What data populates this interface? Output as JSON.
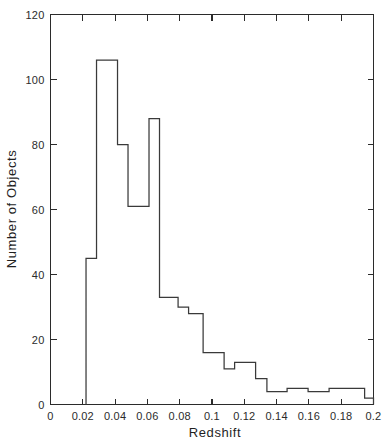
{
  "chart_data": {
    "type": "bar",
    "title": "",
    "xlabel": "Redshift",
    "ylabel": "Number of Objects",
    "xlim": [
      0,
      0.2
    ],
    "ylim": [
      0,
      120
    ],
    "grid": false,
    "legend": null,
    "xticks": [
      "0",
      "0.02",
      "0.04",
      "0.06",
      "0.08",
      "0.1",
      "0.12",
      "0.14",
      "0.16",
      "0.18",
      "0.2"
    ],
    "xtick_values": [
      0,
      0.02,
      0.04,
      0.06,
      0.08,
      0.1,
      0.12,
      0.14,
      0.16,
      0.18,
      0.2
    ],
    "yticks": [
      "0",
      "20",
      "40",
      "60",
      "80",
      "100",
      "120"
    ],
    "ytick_values": [
      0,
      20,
      40,
      60,
      80,
      100,
      120
    ],
    "bin_edges": [
      0.022,
      0.0285,
      0.035,
      0.0415,
      0.048,
      0.0545,
      0.061,
      0.0675,
      0.079,
      0.0905,
      0.102,
      0.1135,
      0.125,
      0.1365,
      0.148,
      0.1595,
      0.171,
      0.194,
      0.2
    ],
    "values": [
      45,
      106,
      106,
      80,
      61,
      61,
      88,
      33,
      30,
      28,
      16,
      11,
      13,
      8,
      4,
      5,
      4,
      5,
      2
    ],
    "bars": [
      {
        "x0": 0.022,
        "x1": 0.0285,
        "value": 45
      },
      {
        "x0": 0.0285,
        "x1": 0.0415,
        "value": 106
      },
      {
        "x0": 0.0415,
        "x1": 0.048,
        "value": 80
      },
      {
        "x0": 0.048,
        "x1": 0.061,
        "value": 61
      },
      {
        "x0": 0.061,
        "x1": 0.0675,
        "value": 88
      },
      {
        "x0": 0.0675,
        "x1": 0.079,
        "value": 33
      },
      {
        "x0": 0.079,
        "x1": 0.0855,
        "value": 30
      },
      {
        "x0": 0.0855,
        "x1": 0.0945,
        "value": 28
      },
      {
        "x0": 0.0945,
        "x1": 0.1075,
        "value": 16
      },
      {
        "x0": 0.1075,
        "x1": 0.114,
        "value": 11
      },
      {
        "x0": 0.114,
        "x1": 0.127,
        "value": 13
      },
      {
        "x0": 0.127,
        "x1": 0.134,
        "value": 8
      },
      {
        "x0": 0.134,
        "x1": 0.1465,
        "value": 4
      },
      {
        "x0": 0.1465,
        "x1": 0.1595,
        "value": 5
      },
      {
        "x0": 0.1595,
        "x1": 0.1725,
        "value": 4
      },
      {
        "x0": 0.1725,
        "x1": 0.1945,
        "value": 5
      },
      {
        "x0": 0.1945,
        "x1": 0.2,
        "value": 2
      }
    ],
    "colors": {
      "axis": "#2b2b2b",
      "line": "#3a3a3a",
      "background": "#ffffff",
      "text": "#1f1f1f"
    }
  }
}
